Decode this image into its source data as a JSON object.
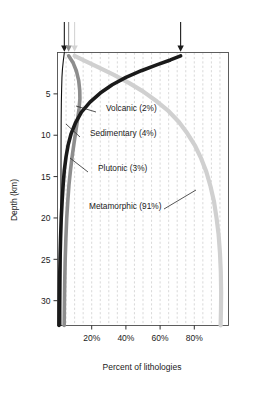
{
  "chart_data": {
    "type": "line",
    "title": "",
    "xlabel": "Percent of lithologies",
    "ylabel": "Depth (km)",
    "xlim": [
      0,
      100
    ],
    "ylim": [
      0,
      33
    ],
    "y_inverted": true,
    "grid": "vertical dashed minor gridlines every 5%",
    "legend": "inline curve labels with leader lines",
    "xticks": [
      20,
      40,
      60,
      80
    ],
    "xticklabels": [
      "20%",
      "40%",
      "60%",
      "80%"
    ],
    "yticks": [
      5,
      10,
      15,
      20,
      25,
      30
    ],
    "yticklabels": [
      "5",
      "10",
      "15",
      "20",
      "25",
      "30"
    ],
    "surface_arrows": [
      {
        "label": "Sedimentary surface",
        "x": 4,
        "color": "#1a1a1a"
      },
      {
        "label": "Plutonic surface",
        "x": 6.5,
        "color": "#8d8d8d"
      },
      {
        "label": "Metamorphic surface",
        "x": 10,
        "color": "#d4d4d4"
      },
      {
        "label": "Volcanic surface",
        "x": 72,
        "color": "#1a1a1a"
      }
    ],
    "series": [
      {
        "name": "Volcanic",
        "label": "Volcanic (2%)",
        "percent": 2,
        "color": "#111111",
        "width": 1.1,
        "points": [
          [
            4,
            0
          ],
          [
            3.4,
            1
          ],
          [
            2.9,
            2
          ],
          [
            2.6,
            3
          ],
          [
            2.4,
            4.5
          ],
          [
            2.25,
            6
          ],
          [
            2.15,
            8
          ],
          [
            2.08,
            11
          ],
          [
            2.04,
            15
          ],
          [
            2.01,
            20
          ],
          [
            2.0,
            26
          ],
          [
            2.0,
            33
          ]
        ]
      },
      {
        "name": "Sedimentary",
        "label": "Sedimentary (4%)",
        "percent": 4,
        "color": "#1a1a1a",
        "width": 3.6,
        "points": [
          [
            72,
            0.4
          ],
          [
            66,
            0.9
          ],
          [
            58,
            1.5
          ],
          [
            49,
            2.2
          ],
          [
            40,
            3.0
          ],
          [
            32,
            3.9
          ],
          [
            25,
            4.9
          ],
          [
            19,
            6.0
          ],
          [
            14,
            7.2
          ],
          [
            10.5,
            8.5
          ],
          [
            8,
            9.8
          ],
          [
            6.2,
            11.2
          ],
          [
            5,
            12.6
          ],
          [
            4,
            14.2
          ],
          [
            3.3,
            16
          ],
          [
            2.7,
            18
          ],
          [
            2.2,
            20
          ],
          [
            1.8,
            22.5
          ],
          [
            1.5,
            25
          ],
          [
            1.2,
            28
          ],
          [
            1.0,
            31
          ],
          [
            0.9,
            33
          ]
        ]
      },
      {
        "name": "Plutonic",
        "label": "Plutonic (3%)",
        "percent": 3,
        "color": "#8d8d8d",
        "width": 3.6,
        "points": [
          [
            6.5,
            0.4
          ],
          [
            9,
            1.2
          ],
          [
            11,
            2.2
          ],
          [
            12.4,
            3.4
          ],
          [
            13,
            4.6
          ],
          [
            13.1,
            5.6
          ],
          [
            12.6,
            6.8
          ],
          [
            11.8,
            8.0
          ],
          [
            10.8,
            9.4
          ],
          [
            9.7,
            10.9
          ],
          [
            8.6,
            12.5
          ],
          [
            7.6,
            14.2
          ],
          [
            6.7,
            16
          ],
          [
            6.0,
            18
          ],
          [
            5.4,
            20
          ],
          [
            4.9,
            22.5
          ],
          [
            4.5,
            25
          ],
          [
            4.2,
            28
          ],
          [
            4.0,
            31
          ],
          [
            3.9,
            33
          ]
        ]
      },
      {
        "name": "Metamorphic",
        "label": "Metamorphic (91%)",
        "percent": 91,
        "color": "#d0d0d0",
        "width": 4.2,
        "points": [
          [
            10,
            0.4
          ],
          [
            16,
            1.0
          ],
          [
            24,
            1.8
          ],
          [
            33,
            2.7
          ],
          [
            42,
            3.7
          ],
          [
            50,
            4.7
          ],
          [
            58,
            5.9
          ],
          [
            65,
            7.1
          ],
          [
            71,
            8.4
          ],
          [
            76,
            9.8
          ],
          [
            80.5,
            11.3
          ],
          [
            84,
            12.8
          ],
          [
            87,
            14.4
          ],
          [
            89.5,
            16.2
          ],
          [
            91.5,
            18
          ],
          [
            93,
            20
          ],
          [
            94.2,
            22
          ],
          [
            95,
            24.2
          ],
          [
            95.5,
            26.5
          ],
          [
            95.7,
            29
          ],
          [
            95.6,
            31
          ],
          [
            95.4,
            33
          ]
        ]
      }
    ],
    "annotations": [
      {
        "text": "Volcanic (2%)",
        "text_x": 106,
        "text_y": 111,
        "leader": [
          [
            76,
            106
          ],
          [
            96,
            112
          ]
        ]
      },
      {
        "text": "Sedimentary (4%)",
        "text_x": 90,
        "text_y": 136,
        "leader": [
          [
            66,
            124
          ],
          [
            80,
            137
          ]
        ]
      },
      {
        "text": "Plutonic (3%)",
        "text_x": 98,
        "text_y": 171,
        "leader": [
          [
            70,
            158
          ],
          [
            88,
            172
          ]
        ]
      },
      {
        "text": "Metamorphic (91%)",
        "text_x": 89,
        "text_y": 209,
        "leader": [
          [
            196,
            190
          ],
          [
            164,
            209
          ]
        ]
      }
    ]
  }
}
